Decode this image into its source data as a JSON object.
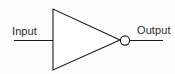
{
  "diagram": {
    "kind": "logic-gate-schematic",
    "gate_name": "NOT",
    "alt_name": "Inverter",
    "background_color": "#fdfdfd",
    "line_color": "#1a1a1a",
    "text_color": "#2b2b2b",
    "ports": {
      "input": {
        "label": "Input",
        "wire_y": 40,
        "wire_x_start": 14,
        "wire_x_end": 53
      },
      "output": {
        "label": "Output",
        "wire_y": 40,
        "wire_x_start": 130,
        "wire_x_end": 163
      }
    },
    "body": {
      "shape": "triangle",
      "points": "53,9 53,70 120,40",
      "apex_x": 120,
      "apex_y": 40,
      "left_x": 53,
      "top_y": 9,
      "bottom_y": 70
    },
    "bubble": {
      "shape": "circle",
      "cx": 125,
      "cy": 40,
      "r": 4.6,
      "meaning": "inversion"
    }
  }
}
